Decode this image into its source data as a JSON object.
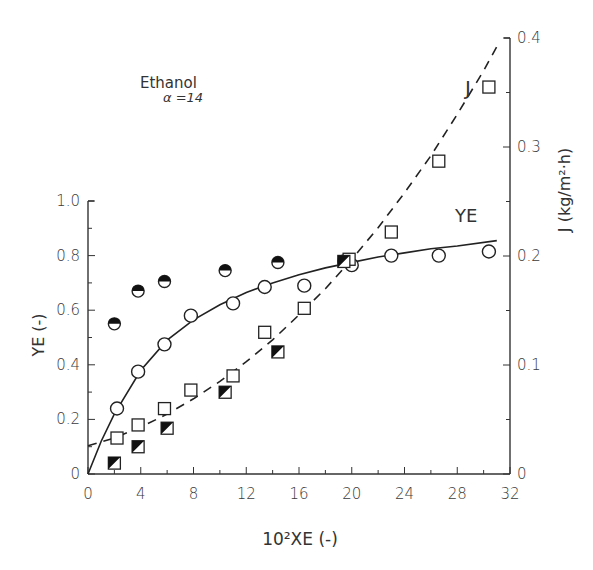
{
  "chart_data": {
    "type": "scatter",
    "title": "Ethanol",
    "subtitle": "α =14",
    "xlabel": "10²XE (-)",
    "ylabel": "YE (-)",
    "y2label": "J (kg/m²·h)",
    "xlim": [
      0,
      32
    ],
    "ylim": [
      0,
      1.0
    ],
    "y2lim": [
      0,
      0.4
    ],
    "x_ticks": [
      "0",
      "4",
      "8",
      "12",
      "16",
      "20",
      "24",
      "28",
      "32"
    ],
    "y_ticks": [
      "0",
      "0.2",
      "0.4",
      "0.6",
      "0.8",
      "1.0"
    ],
    "y2_ticks": [
      "0",
      "0.1",
      "0.2",
      "0.3",
      "0.4"
    ],
    "grid": false,
    "annotations": [
      {
        "text": "J",
        "near": "dashed curve upper right"
      },
      {
        "text": "YE",
        "near": "solid curve right"
      }
    ],
    "series": [
      {
        "name": "YE (open circles)",
        "axis": "left",
        "marker": "open-circle",
        "x": [
          2.2,
          3.8,
          5.8,
          7.8,
          11.0,
          13.4,
          16.4,
          20.0,
          23.0,
          26.6,
          30.4
        ],
        "y": [
          0.24,
          0.375,
          0.475,
          0.58,
          0.625,
          0.685,
          0.69,
          0.765,
          0.8,
          0.8,
          0.815
        ]
      },
      {
        "name": "YE (half-filled circles)",
        "axis": "left",
        "marker": "half-filled-circle",
        "x": [
          2.0,
          3.8,
          5.8,
          10.4,
          14.4,
          19.4
        ],
        "y": [
          0.55,
          0.67,
          0.705,
          0.745,
          0.775,
          0.78
        ]
      },
      {
        "name": "J (open squares)",
        "axis": "right",
        "marker": "open-square",
        "x": [
          2.2,
          3.8,
          5.8,
          7.8,
          11.0,
          13.4,
          16.4,
          19.8,
          23.0,
          26.6,
          30.4
        ],
        "y": [
          0.033,
          0.045,
          0.06,
          0.077,
          0.09,
          0.13,
          0.152,
          0.197,
          0.222,
          0.287,
          0.355
        ]
      },
      {
        "name": "J (half-filled squares)",
        "axis": "right",
        "marker": "half-filled-square",
        "x": [
          2.0,
          3.8,
          6.0,
          10.4,
          14.4,
          19.4
        ],
        "y": [
          0.01,
          0.025,
          0.042,
          0.075,
          0.112,
          0.195
        ]
      },
      {
        "name": "YE fit",
        "axis": "left",
        "line": "solid",
        "x": [
          0,
          1,
          2,
          4,
          6,
          8,
          10,
          12,
          14,
          16,
          18,
          20,
          22,
          24,
          26,
          28,
          31
        ],
        "y": [
          0,
          0.12,
          0.22,
          0.38,
          0.49,
          0.565,
          0.62,
          0.665,
          0.7,
          0.73,
          0.755,
          0.775,
          0.795,
          0.81,
          0.825,
          0.835,
          0.855
        ]
      },
      {
        "name": "J fit",
        "axis": "right",
        "line": "dashed",
        "x": [
          0,
          2,
          4,
          6,
          8,
          10,
          12,
          14,
          16,
          18,
          20,
          22,
          24,
          26,
          28,
          30,
          31
        ],
        "y": [
          0.026,
          0.033,
          0.043,
          0.055,
          0.069,
          0.085,
          0.103,
          0.123,
          0.146,
          0.17,
          0.197,
          0.226,
          0.258,
          0.292,
          0.33,
          0.37,
          0.392
        ]
      }
    ]
  },
  "labels": {
    "title": "Ethanol",
    "subtitle": "α =14",
    "xlabel": "10²XE (-)",
    "ylabel": "YE (-)",
    "y2label": "J (kg/m²·h)",
    "j_annotation": "J",
    "ye_annotation": "YE"
  }
}
